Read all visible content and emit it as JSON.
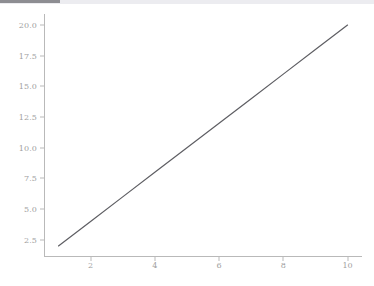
{
  "window": {
    "scrollbar": {
      "name": "horizontal-scrollbar",
      "thumb_color": "#8d8d92",
      "track_color": "#ececf0"
    }
  },
  "figure": {
    "background_color": "#ffffff",
    "spine_color": "#b9b9b9",
    "tick_label_color": "#a0a0a0",
    "line_color": "#5e5e63"
  },
  "chart_data": {
    "type": "line",
    "title": "",
    "subtitle": "",
    "xlabel": "",
    "ylabel": "",
    "legend": [],
    "legend_position": "none",
    "grid": false,
    "xlim": [
      0.55,
      10.45
    ],
    "ylim": [
      1.1,
      20.9
    ],
    "xticks": [
      2,
      4,
      6,
      8,
      10
    ],
    "xticklabels": [
      "2",
      "4",
      "6",
      "8",
      "10"
    ],
    "yticks": [
      2.5,
      5.0,
      7.5,
      10.0,
      12.5,
      15.0,
      17.5,
      20.0
    ],
    "yticklabels": [
      "2.5",
      "5.0",
      "7.5",
      "10.0",
      "12.5",
      "15.0",
      "17.5",
      "20.0"
    ],
    "x": [
      1,
      2,
      3,
      4,
      5,
      6,
      7,
      8,
      9,
      10
    ],
    "series": [
      {
        "name": "",
        "values": [
          2,
          4,
          6,
          8,
          10,
          12,
          14,
          16,
          18,
          20
        ],
        "color": "#5e5e63",
        "linewidth": 1.2,
        "marker": "none"
      }
    ],
    "annotations": []
  }
}
